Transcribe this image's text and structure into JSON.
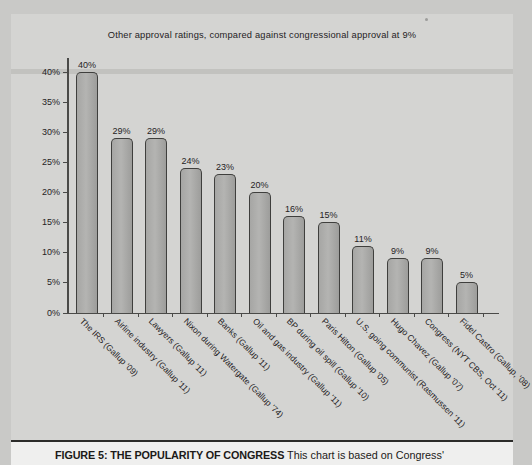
{
  "figure": {
    "caption_lead": "FIGURE 5: THE POPULARITY OF CONGRESS",
    "caption_body": " This chart is based on Congress'"
  },
  "chart_data": {
    "type": "bar",
    "title": "Other approval ratings, compared against congressional approval at 9%",
    "xlabel": "",
    "ylabel": "",
    "ylim": [
      0,
      40
    ],
    "ytick_labels": [
      "40%",
      "35%",
      "30%",
      "25%",
      "20%",
      "15%",
      "10%",
      "5%",
      "0%"
    ],
    "ytick_values": [
      40,
      35,
      30,
      25,
      20,
      15,
      10,
      5,
      0
    ],
    "grid": false,
    "legend": "none",
    "categories": [
      "The IRS (Gallup '09)",
      "Airline industry (Gallup '11)",
      "Lawyers (Gallup '11)",
      "Nixon during Watergate (Gallup '74)",
      "Banks (Gallup '11)",
      "Oil and gas industry (Gallup '11)",
      "BP during oil spill (Gallup '10)",
      "Paris Hilton (Gallup '05)",
      "U.S. going communist (Rasmussen '11)",
      "Hugo Chavez (Gallup '07)",
      "Congress (NYT CBS, Oct '11)",
      "Fidel Castro (Gallup, '08)"
    ],
    "values": [
      40,
      29,
      29,
      24,
      23,
      20,
      16,
      15,
      11,
      9,
      9,
      5
    ],
    "value_labels": [
      "40%",
      "29%",
      "29%",
      "24%",
      "23%",
      "20%",
      "16%",
      "15%",
      "11%",
      "9%",
      "9%",
      "5%"
    ],
    "bar_fill_color": "#acacaa",
    "bar_edge_color": "#3f3f3d",
    "background_color": "#d4d4d2",
    "text_color": "#25221f"
  }
}
